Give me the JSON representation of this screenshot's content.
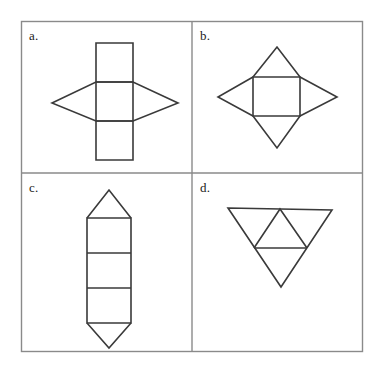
{
  "figure": {
    "background_color": "#ffffff",
    "stroke_color": "#3a3a3a",
    "border_color": "#8a8a8a",
    "panels": [
      {
        "id": "a",
        "label": "a.",
        "shape_name": "rectangular-column-with-rhombus-net",
        "description": "Three stacked squares in a vertical column overlaid by a horizontal rhombus centered on the middle square"
      },
      {
        "id": "b",
        "label": "b.",
        "shape_name": "square-pyramid-net",
        "description": "Central square with four isosceles triangles attached to each side forming a four pointed star"
      },
      {
        "id": "c",
        "label": "c.",
        "shape_name": "triangular-prism-net",
        "description": "Three stacked rectangles in a vertical column with a triangle on the top and a triangle on the bottom"
      },
      {
        "id": "d",
        "label": "d.",
        "shape_name": "tetrahedron-net",
        "description": "Large downward pointing triangle subdivided into four smaller triangles"
      }
    ]
  },
  "chart_data": {
    "type": "diagram",
    "layout": {
      "outer_border": {
        "x": 21,
        "y": 21,
        "width": 342,
        "height": 331
      },
      "vertical_divider_x": 192,
      "horizontal_divider_y": 173,
      "grid": "2x2"
    },
    "panels": [
      {
        "id": "a",
        "label": "a.",
        "label_position": {
          "x": 29,
          "y": 29
        },
        "net_of": "rectangular prism / rhombic solid",
        "polylines": [
          {
            "name": "column-outline",
            "closed": true,
            "points": [
              [
                96,
                43
              ],
              [
                133,
                43
              ],
              [
                133,
                160
              ],
              [
                96,
                160
              ]
            ]
          },
          {
            "name": "column-divider-upper",
            "closed": false,
            "points": [
              [
                96,
                82
              ],
              [
                133,
                82
              ]
            ]
          },
          {
            "name": "column-divider-lower",
            "closed": false,
            "points": [
              [
                96,
                121
              ],
              [
                133,
                121
              ]
            ]
          },
          {
            "name": "rhombus",
            "closed": true,
            "points": [
              [
                52,
                103
              ],
              [
                96,
                82
              ],
              [
                133,
                82
              ],
              [
                178,
                103
              ],
              [
                133,
                121
              ],
              [
                96,
                121
              ]
            ]
          }
        ]
      },
      {
        "id": "b",
        "label": "b.",
        "label_position": {
          "x": 200,
          "y": 29
        },
        "net_of": "square pyramid",
        "polylines": [
          {
            "name": "center-square",
            "closed": true,
            "points": [
              [
                253,
                77
              ],
              [
                300,
                77
              ],
              [
                300,
                116
              ],
              [
                253,
                116
              ]
            ]
          },
          {
            "name": "triangle-top",
            "closed": false,
            "points": [
              [
                253,
                77
              ],
              [
                277,
                47
              ],
              [
                300,
                77
              ]
            ]
          },
          {
            "name": "triangle-right",
            "closed": false,
            "points": [
              [
                300,
                77
              ],
              [
                337,
                97
              ],
              [
                300,
                116
              ]
            ]
          },
          {
            "name": "triangle-bottom",
            "closed": false,
            "points": [
              [
                300,
                116
              ],
              [
                277,
                148
              ],
              [
                253,
                116
              ]
            ]
          },
          {
            "name": "triangle-left",
            "closed": false,
            "points": [
              [
                253,
                116
              ],
              [
                218,
                97
              ],
              [
                253,
                77
              ]
            ]
          }
        ]
      },
      {
        "id": "c",
        "label": "c.",
        "label_position": {
          "x": 29,
          "y": 181
        },
        "net_of": "triangular prism",
        "polylines": [
          {
            "name": "column-outline",
            "closed": true,
            "points": [
              [
                87,
                218
              ],
              [
                131,
                218
              ],
              [
                131,
                323
              ],
              [
                87,
                323
              ]
            ]
          },
          {
            "name": "column-divider-upper",
            "closed": false,
            "points": [
              [
                87,
                253
              ],
              [
                131,
                253
              ]
            ]
          },
          {
            "name": "column-divider-lower",
            "closed": false,
            "points": [
              [
                87,
                288
              ],
              [
                131,
                288
              ]
            ]
          },
          {
            "name": "triangle-top",
            "closed": false,
            "points": [
              [
                87,
                218
              ],
              [
                109,
                190
              ],
              [
                131,
                218
              ]
            ]
          },
          {
            "name": "triangle-bottom",
            "closed": false,
            "points": [
              [
                87,
                323
              ],
              [
                109,
                348
              ],
              [
                131,
                323
              ]
            ]
          }
        ]
      },
      {
        "id": "d",
        "label": "d.",
        "label_position": {
          "x": 200,
          "y": 181
        },
        "net_of": "tetrahedron",
        "polylines": [
          {
            "name": "outer-triangle",
            "closed": true,
            "points": [
              [
                228,
                208
              ],
              [
                332,
                210
              ],
              [
                281,
                287
              ]
            ]
          },
          {
            "name": "inner-triangle-left-edge",
            "closed": false,
            "points": [
              [
                280,
                209
              ],
              [
                254,
                248
              ]
            ]
          },
          {
            "name": "inner-triangle-right-edge",
            "closed": false,
            "points": [
              [
                280,
                209
              ],
              [
                307,
                248
              ]
            ]
          },
          {
            "name": "inner-triangle-base",
            "closed": false,
            "points": [
              [
                254,
                248
              ],
              [
                307,
                248
              ]
            ]
          }
        ]
      }
    ]
  }
}
